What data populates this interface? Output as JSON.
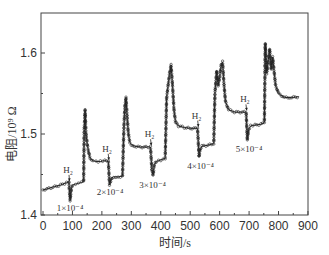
{
  "chart_data": {
    "type": "line",
    "title": "",
    "xlabel": "时间/s",
    "ylabel": "电阻/10⁹ Ω",
    "xlim": [
      0,
      900
    ],
    "ylim": [
      1.4,
      1.65
    ],
    "xticks": [
      0,
      100,
      200,
      300,
      400,
      500,
      600,
      700,
      800,
      900
    ],
    "yticks": [
      1.4,
      1.5,
      1.6
    ],
    "grid": false,
    "legend": null,
    "series": [
      {
        "name": "resistance",
        "x": [
          0,
          20,
          40,
          60,
          80,
          88,
          92,
          96,
          100,
          110,
          120,
          130,
          138,
          140,
          143,
          146,
          150,
          155,
          160,
          170,
          180,
          195,
          210,
          222,
          226,
          230,
          234,
          240,
          255,
          270,
          275,
          278,
          282,
          286,
          290,
          295,
          300,
          310,
          330,
          350,
          365,
          370,
          374,
          378,
          385,
          400,
          415,
          420,
          425,
          430,
          435,
          440,
          445,
          450,
          460,
          480,
          500,
          525,
          530,
          534,
          540,
          560,
          580,
          584,
          590,
          595,
          600,
          605,
          610,
          615,
          620,
          630,
          650,
          670,
          690,
          694,
          698,
          705,
          720,
          740,
          752,
          755,
          760,
          765,
          770,
          775,
          780,
          790,
          800,
          820,
          845,
          870
        ],
        "y": [
          1.431,
          1.433,
          1.435,
          1.437,
          1.44,
          1.441,
          1.418,
          1.432,
          1.437,
          1.438,
          1.439,
          1.44,
          1.441,
          1.505,
          1.53,
          1.5,
          1.488,
          1.478,
          1.47,
          1.467,
          1.466,
          1.466,
          1.467,
          1.466,
          1.437,
          1.442,
          1.446,
          1.447,
          1.447,
          1.448,
          1.51,
          1.533,
          1.545,
          1.52,
          1.5,
          1.49,
          1.487,
          1.485,
          1.484,
          1.484,
          1.484,
          1.455,
          1.449,
          1.462,
          1.466,
          1.468,
          1.47,
          1.545,
          1.56,
          1.575,
          1.585,
          1.56,
          1.53,
          1.515,
          1.51,
          1.508,
          1.507,
          1.507,
          1.472,
          1.48,
          1.485,
          1.486,
          1.488,
          1.55,
          1.578,
          1.56,
          1.57,
          1.585,
          1.589,
          1.56,
          1.54,
          1.53,
          1.527,
          1.527,
          1.527,
          1.493,
          1.505,
          1.51,
          1.511,
          1.512,
          1.514,
          1.612,
          1.575,
          1.59,
          1.605,
          1.58,
          1.595,
          1.56,
          1.55,
          1.545,
          1.545,
          1.546
        ]
      }
    ],
    "annotations": [
      {
        "text": "H₂",
        "x": 85,
        "y": 1.452,
        "arrow_to": [
          90,
          1.442
        ]
      },
      {
        "text": "1×10⁻⁴",
        "x": 92,
        "y": 1.405
      },
      {
        "text": "H₂",
        "x": 218,
        "y": 1.478,
        "arrow_to": [
          224,
          1.468
        ]
      },
      {
        "text": "2×10⁻⁴",
        "x": 228,
        "y": 1.425
      },
      {
        "text": "H₂",
        "x": 362,
        "y": 1.496,
        "arrow_to": [
          368,
          1.486
        ]
      },
      {
        "text": "3×10⁻⁴",
        "x": 372,
        "y": 1.433
      },
      {
        "text": "H₂",
        "x": 522,
        "y": 1.519,
        "arrow_to": [
          528,
          1.509
        ]
      },
      {
        "text": "4×10⁻⁴",
        "x": 535,
        "y": 1.457
      },
      {
        "text": "H₂",
        "x": 686,
        "y": 1.539,
        "arrow_to": [
          692,
          1.529
        ]
      },
      {
        "text": "5×10⁻⁴",
        "x": 700,
        "y": 1.478
      }
    ]
  }
}
